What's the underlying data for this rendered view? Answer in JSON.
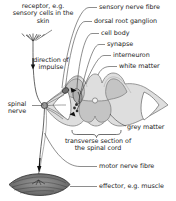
{
  "diagram": {
    "colors": {
      "ink": "#1a1a1a",
      "outline": "#3a3a3a",
      "grey_matter": "#c4c4c4",
      "white_matter": "#dedede",
      "cord_edge": "#8f8f8f",
      "nerve": "#5a5a5a",
      "effector": "#8a8a8a",
      "background": "#ffffff"
    }
  },
  "labels": {
    "receptor": "receptor, e.g. sensory cells in the skin",
    "direction_of_impulse": "direction of impulse",
    "spinal_nerve": "spinal nerve",
    "sensory_nerve_fibre": "sensory nerve fibre",
    "dorsal_root_ganglion": "dorsal root ganglion",
    "cell_body": "cell body",
    "synapse": "synapse",
    "interneuron": "interneuron",
    "white_matter": "white matter",
    "grey_matter": "grey matter",
    "transverse_section": "transverse section of the spinal cord",
    "motor_nerve_fibre": "motor nerve fibre",
    "effector": "effector, e.g. muscle"
  },
  "structures": [
    {
      "name": "receptor",
      "kind": "sensory-nerve-ending"
    },
    {
      "name": "sensory-nerve-fibre",
      "kind": "axon"
    },
    {
      "name": "dorsal-root-ganglion",
      "kind": "ganglion"
    },
    {
      "name": "cell-body",
      "kind": "soma"
    },
    {
      "name": "synapse",
      "kind": "junction"
    },
    {
      "name": "interneuron",
      "kind": "neuron"
    },
    {
      "name": "white-matter",
      "kind": "cord-region"
    },
    {
      "name": "grey-matter",
      "kind": "cord-region"
    },
    {
      "name": "central-canal",
      "kind": "cord-region"
    },
    {
      "name": "motor-nerve-fibre",
      "kind": "axon"
    },
    {
      "name": "effector",
      "kind": "muscle"
    },
    {
      "name": "spinal-nerve",
      "kind": "nerve-trunk"
    }
  ]
}
